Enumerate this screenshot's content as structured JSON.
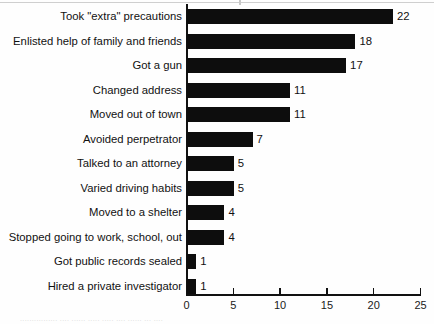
{
  "chart_data": {
    "type": "bar",
    "orientation": "horizontal",
    "title": "",
    "subtitle": "",
    "xlabel": "",
    "ylabel": "",
    "xlim": [
      0,
      25
    ],
    "xticks": [
      0,
      5,
      10,
      15,
      20,
      25
    ],
    "grid": false,
    "legend": null,
    "bar_color": "#0d0d0d",
    "categories": [
      "Took \"extra\" precautions",
      "Enlisted help of family and friends",
      "Got a gun",
      "Changed address",
      "Moved out of town",
      "Avoided perpetrator",
      "Talked to an attorney",
      "Varied driving habits",
      "Moved to a shelter",
      "Stopped going to work, school, out",
      "Got public records sealed",
      "Hired a private investigator"
    ],
    "values": [
      22,
      18,
      17,
      11,
      11,
      7,
      5,
      5,
      4,
      4,
      1,
      1
    ],
    "value_labels": [
      "22",
      "18",
      "17",
      "11",
      "11",
      "7",
      "5",
      "5",
      "4",
      "4",
      "1",
      "1"
    ],
    "tick_labels": [
      "0",
      "5",
      "10",
      "15",
      "20",
      "25"
    ]
  },
  "footer": {
    "caption_ghost": "................ .... ...... ..... ..... .... ...... ... ...."
  }
}
